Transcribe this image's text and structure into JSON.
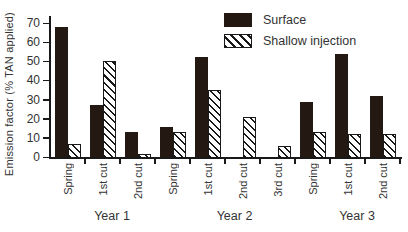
{
  "chart_data": {
    "type": "bar",
    "title": "",
    "ylabel": "Emission factor (% TAN applied)",
    "xlabel": "",
    "ylim": [
      0,
      70
    ],
    "yticks": [
      0,
      10,
      20,
      30,
      40,
      50,
      60,
      70
    ],
    "grid": false,
    "legend": {
      "position": "top-center-inside",
      "entries": [
        "Surface",
        "Shallow injection"
      ]
    },
    "categories": [
      "Spring",
      "1st cut",
      "2nd cut",
      "Spring",
      "1st cut",
      "2nd cut",
      "3rd cut",
      "Spring",
      "1st cut",
      "2nd cut"
    ],
    "series": [
      {
        "name": "Surface",
        "pattern": "solid",
        "color": "#241813",
        "values": [
          68,
          27,
          13,
          15.5,
          52.5,
          null,
          null,
          28.5,
          54,
          32
        ]
      },
      {
        "name": "Shallow injection",
        "pattern": "diagonal-hatch",
        "color": "#ffffff",
        "hatch_color": "#191919",
        "values": [
          7,
          50,
          1.5,
          13,
          35,
          21,
          6,
          13,
          12,
          12
        ]
      }
    ],
    "year_groups": [
      {
        "label": "Year 1",
        "categories": 3
      },
      {
        "label": "Year 2",
        "categories": 4
      },
      {
        "label": "Year 3",
        "categories": 3
      }
    ]
  },
  "colors": {
    "axis": "#191919",
    "text": "#333333",
    "bar_fill": "#241813",
    "background": "#ffffff"
  }
}
